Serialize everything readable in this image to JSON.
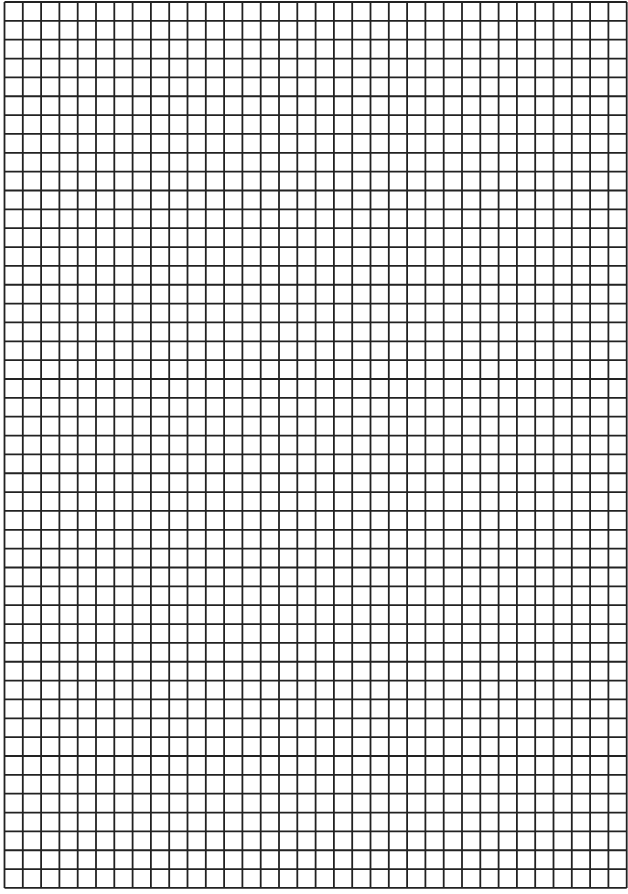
{
  "page": {
    "type": "grid-paper",
    "background": "#ffffff",
    "width": 628,
    "height": 894
  },
  "grid": {
    "left": 4.5,
    "top": 2,
    "columns": 34,
    "rows": 47,
    "cell_width": 18.3,
    "cell_height": 18.85,
    "line_color": "#222222",
    "line_width": 1.8
  }
}
